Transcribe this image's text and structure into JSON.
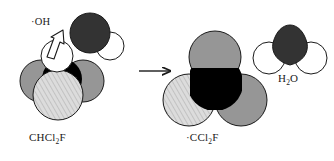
{
  "figure": {
    "type": "reaction-scheme",
    "background_color": "#ffffff",
    "width": 334,
    "height": 161
  },
  "labels": {
    "reactant_formula": "CHCl",
    "reactant_formula_sub": "2",
    "reactant_formula_tail": "F",
    "hydroxyl_radical": "·OH",
    "product_formula": "·CCl",
    "product_formula_sub": "2",
    "product_formula_tail": "F",
    "water": "H",
    "water_sub": "2",
    "water_tail": "O"
  },
  "reaction_arrow": {
    "name": "reaction-arrow",
    "direction": "right",
    "x1": 139,
    "y1": 71,
    "x2": 172,
    "y2": 71
  },
  "attack_arrow": {
    "name": "hydrogen-abstraction-arrow",
    "description": "open white outlined arrow from the hydrogen atom toward the hydroxyl oxygen",
    "fill": "#ffffff",
    "stroke": "#1a1a1a"
  },
  "colors": {
    "carbon": "#000000",
    "chlorine": "#969696",
    "chlorine_shadow": "#6e6e6e",
    "fluorine": "#dcdcdc",
    "fluorine_hatch": "#a8a8a8",
    "hydrogen": "#ffffff",
    "oxygen": "#333333",
    "outline": "#1a1a1a"
  },
  "molecules": [
    {
      "name": "reactant-chcl2f",
      "formula": "CHCl2F",
      "side": "left",
      "atoms": [
        {
          "element": "Cl",
          "role": "chlorine-back-left",
          "color": "#969696",
          "cx": 41,
          "cy": 81,
          "r": 21
        },
        {
          "element": "Cl",
          "role": "chlorine-back-right",
          "color": "#969696",
          "cx": 83,
          "cy": 81,
          "r": 21
        },
        {
          "element": "C",
          "role": "carbon-center",
          "color": "#000000",
          "cx": 62,
          "cy": 79,
          "r": 19
        },
        {
          "element": "F",
          "role": "fluorine-front",
          "color": "#dcdcdc",
          "cx": 58,
          "cy": 95,
          "r": 25
        },
        {
          "element": "H",
          "role": "hydrogen-top",
          "color": "#ffffff",
          "cx": 57,
          "cy": 56,
          "r": 16
        }
      ]
    },
    {
      "name": "reactant-hydroxyl-radical",
      "formula": "OH",
      "side": "left",
      "atoms": [
        {
          "element": "O",
          "role": "oxygen",
          "color": "#333333",
          "cx": 90,
          "cy": 33,
          "r": 20
        },
        {
          "element": "H",
          "role": "hydrogen",
          "color": "#ffffff",
          "cx": 110,
          "cy": 46,
          "r": 14
        }
      ]
    },
    {
      "name": "product-ccl2f-radical",
      "formula": "CCl2F",
      "side": "right",
      "atoms": [
        {
          "element": "Cl",
          "role": "chlorine-top",
          "color": "#969696",
          "cx": 215,
          "cy": 57,
          "r": 26
        },
        {
          "element": "Cl",
          "role": "chlorine-right",
          "color": "#969696",
          "cx": 241,
          "cy": 100,
          "r": 26
        },
        {
          "element": "F",
          "role": "fluorine-left",
          "color": "#dcdcdc",
          "cx": 189,
          "cy": 100,
          "r": 26
        },
        {
          "element": "C",
          "role": "carbon-center",
          "color": "#000000",
          "cx": 215,
          "cy": 85,
          "r": 20
        }
      ]
    },
    {
      "name": "product-water",
      "formula": "H2O",
      "side": "right",
      "atoms": [
        {
          "element": "O",
          "role": "oxygen",
          "color": "#333333",
          "cx": 290,
          "cy": 42,
          "r": 21
        },
        {
          "element": "H",
          "role": "hydrogen-left",
          "color": "#ffffff",
          "cx": 269,
          "cy": 58,
          "r": 16
        },
        {
          "element": "H",
          "role": "hydrogen-right",
          "color": "#ffffff",
          "cx": 311,
          "cy": 58,
          "r": 16
        }
      ]
    }
  ]
}
